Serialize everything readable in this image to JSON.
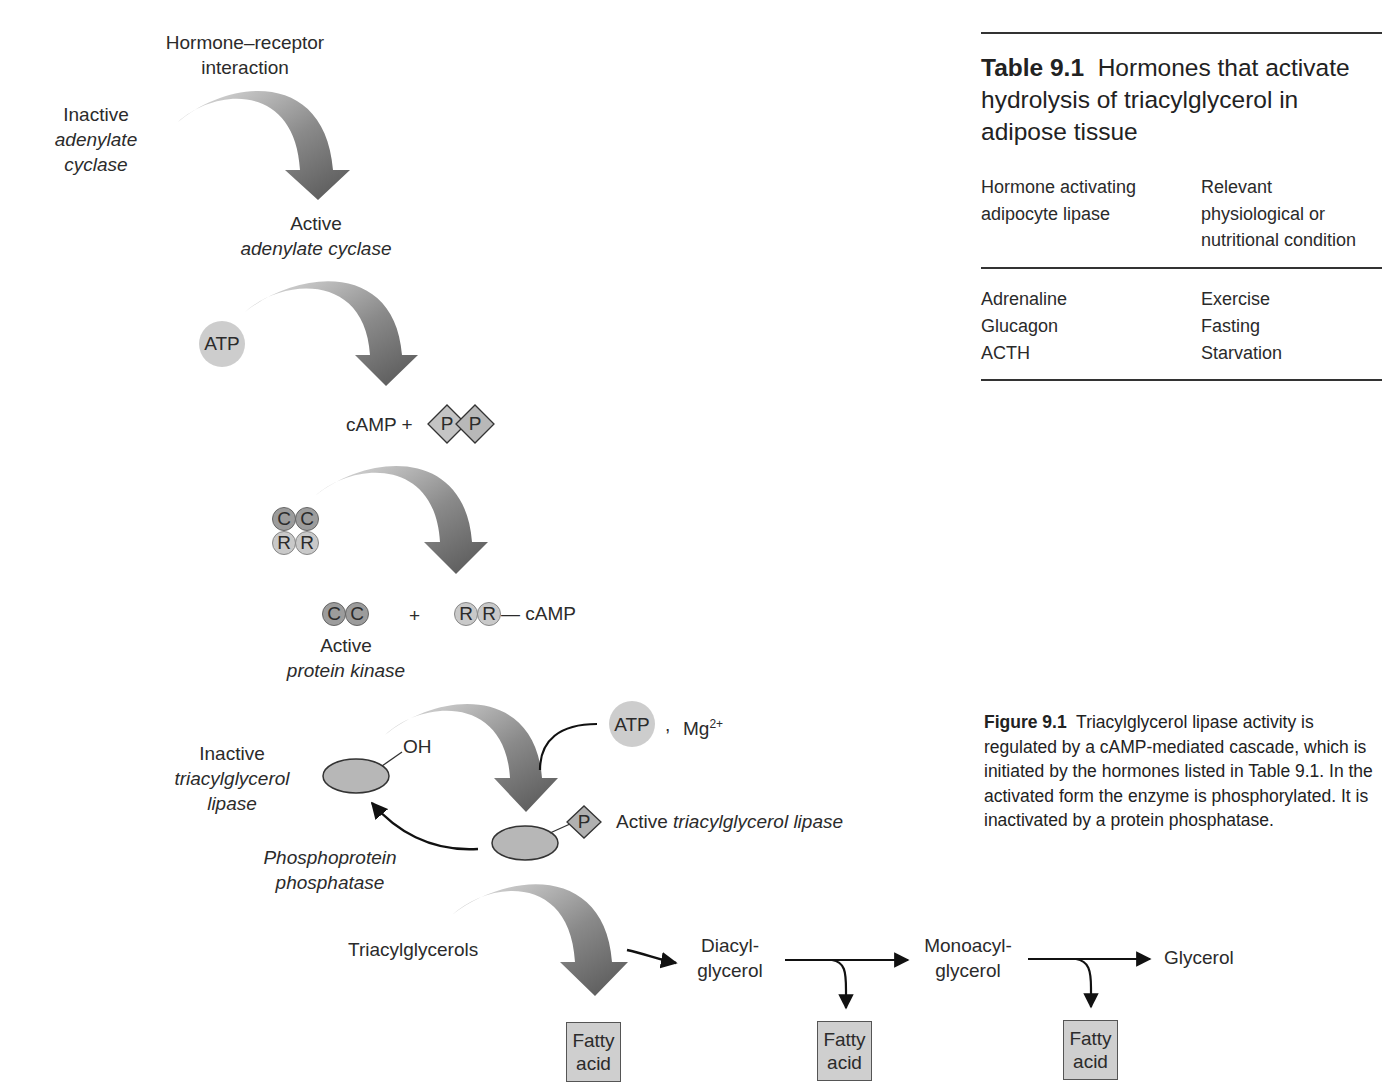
{
  "cascade": {
    "step1": {
      "signal": "Hormone–receptor interaction",
      "signal_line1": "Hormone–receptor",
      "signal_line2": "interaction",
      "from_line1": "Inactive",
      "from_line2": "adenylate",
      "from_line3": "cyclase",
      "to_line1": "Active",
      "to_line2": "adenylate cyclase"
    },
    "step2": {
      "substrate": "ATP",
      "product": "cAMP +",
      "pyrophosphate": [
        "P",
        "P"
      ]
    },
    "step3": {
      "holoenzyme_top": [
        "C",
        "C"
      ],
      "holoenzyme_bottom": [
        "R",
        "R"
      ],
      "catalytic": [
        "C",
        "C"
      ],
      "plus": "+",
      "regulatory": [
        "R",
        "R"
      ],
      "regulatory_bound": "— cAMP",
      "product_line1": "Active",
      "product_line2": "protein kinase"
    },
    "step4": {
      "cofactor_atp": "ATP",
      "cofactor_sep": ",",
      "cofactor_mg": "Mg",
      "cofactor_mg_charge": "2+",
      "inactive_group": "OH",
      "inactive_line1": "Inactive",
      "inactive_line2": "triacylglycerol",
      "inactive_line3": "lipase",
      "phospho_group": "P",
      "active_prefix": "Active",
      "active_name": "triacylglycerol lipase",
      "phosphatase_line1": "Phosphoprotein",
      "phosphatase_line2": "phosphatase"
    },
    "hydrolysis": {
      "substrate": "Triacylglycerols",
      "intermediate1_line1": "Diacyl-",
      "intermediate1_line2": "glycerol",
      "intermediate2_line1": "Monoacyl-",
      "intermediate2_line2": "glycerol",
      "final": "Glycerol",
      "byproduct_line1": "Fatty",
      "byproduct_line2": "acid"
    }
  },
  "table": {
    "label": "Table 9.1",
    "title": "Hormones that activate hydrolysis of triacylglycerol in adipose tissue",
    "title_line1_rest": "Hormones that activate",
    "title_line2": "hydrolysis of triacylglycerol in",
    "title_line3": "adipose tissue",
    "headers": {
      "col1_line1": "Hormone activating",
      "col1_line2": "adipocyte  lipase",
      "col2_line1": "Relevant",
      "col2_line2": "physiological or",
      "col2_line3": "nutritional condition"
    },
    "rows": [
      {
        "hormone": "Adrenaline",
        "condition": "Exercise"
      },
      {
        "hormone": "Glucagon",
        "condition": "Fasting"
      },
      {
        "hormone": "ACTH",
        "condition": "Starvation"
      }
    ]
  },
  "caption": {
    "label": "Figure 9.1",
    "text": "Triacylglycerol lipase activity is regulated by a cAMP-mediated cascade, which is initiated by the hormones listed in Table 9.1. In the activated form the enzyme is phosphorylated. It is inactivated by a protein phosphatase."
  },
  "colors": {
    "arrow_light": "#d8d8d8",
    "arrow_dark": "#5e5e5e",
    "molecule_fill": "#c8c8c8",
    "enzyme_fill": "#b5b5b5",
    "box_fill": "#cfcfcf",
    "rule": "#333333"
  }
}
